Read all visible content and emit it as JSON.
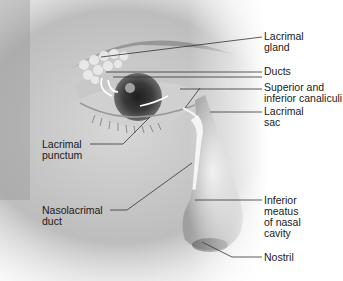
{
  "diagram": {
    "labels": {
      "lacrimal_gland": [
        "Lacrimal",
        "gland"
      ],
      "ducts": [
        "Ducts"
      ],
      "canaliculi": [
        "Superior and",
        "inferior canaliculi"
      ],
      "lacrimal_sac": [
        "Lacrimal",
        "sac"
      ],
      "lacrimal_punctum": [
        "Lacrimal",
        "punctum"
      ],
      "nasolacrimal_duct": [
        "Nasolacrimal",
        "duct"
      ],
      "inferior_meatus": [
        "Inferior",
        "meatus",
        "of nasal",
        "cavity"
      ],
      "nostril": [
        "Nostril"
      ]
    },
    "colors": {
      "background": "#ffffff",
      "skin_dark": "#6e6e6e",
      "skin_light": "#e6e6e6",
      "leader_line": "#333333",
      "text": "#1a1a1a"
    }
  }
}
